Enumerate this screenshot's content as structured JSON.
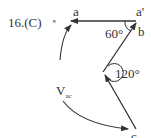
{
  "problem": {
    "number_label": "16.(C)",
    "separator": "∘"
  },
  "diagram": {
    "points": {
      "a": "a",
      "a_prime": "a'",
      "b": "b",
      "c": "c"
    },
    "angles": {
      "angle_b": "60°",
      "angle_vertex": "120°"
    },
    "vector_label": {
      "main": "V",
      "sub": "ac"
    },
    "line_color": "#333333"
  }
}
